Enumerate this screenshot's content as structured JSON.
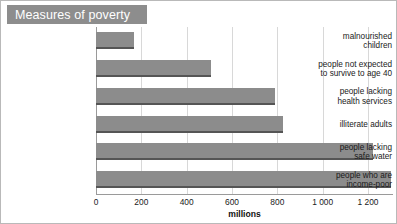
{
  "banner": {
    "title": "Measures of poverty",
    "bg_color": "#8d8d8d",
    "text_color": "#ffffff"
  },
  "chart_data": {
    "type": "bar",
    "orientation": "horizontal",
    "title": "Measures of poverty",
    "xlabel": "millions",
    "ylabel": "",
    "xlim": [
      0,
      1310
    ],
    "grid": true,
    "legend": "none",
    "bar_color": "#8c8c8c",
    "bar_edge_color": "#555555",
    "categories": [
      "malnourished children",
      "people not expected to survive to age 40",
      "people lacking health services",
      "illiterate adults",
      "people lacking safe water",
      "people who are income-poor"
    ],
    "category_lines": [
      [
        "malnourished",
        "children"
      ],
      [
        "people not expected",
        "to survive to age 40"
      ],
      [
        "people lacking",
        "health services"
      ],
      [
        "illiterate adults"
      ],
      [
        "people lacking",
        "safe water"
      ],
      [
        "people who are",
        "income-poor"
      ]
    ],
    "values": [
      166,
      507,
      790,
      825,
      1220,
      1300
    ],
    "xticks": [
      0,
      200,
      400,
      600,
      800,
      1000,
      1200
    ],
    "xtick_labels": [
      "0",
      "200",
      "400",
      "600",
      "800",
      "1 000",
      "1 200"
    ]
  }
}
